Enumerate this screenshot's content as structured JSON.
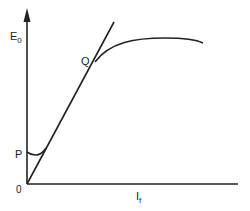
{
  "diagram": {
    "type": "characteristic-curve",
    "axes": {
      "y_label_main": "E",
      "y_label_sub": "0",
      "x_label_main": "I",
      "x_label_sub": "f",
      "origin_label": "0"
    },
    "points": {
      "p_label": "P",
      "q_label": "Q"
    },
    "colors": {
      "stroke": "#222222",
      "background": "#ffffff"
    }
  }
}
